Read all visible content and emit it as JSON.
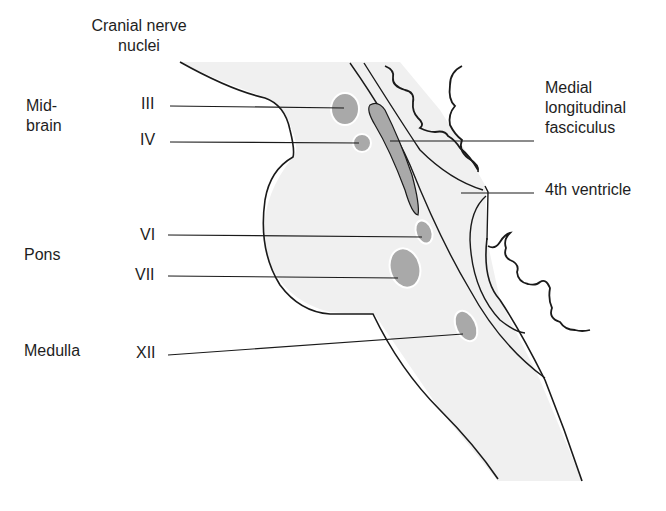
{
  "title": {
    "line1": "Cranial nerve",
    "line2": "nuclei"
  },
  "regions": [
    {
      "id": "midbrain",
      "line1": "Mid-",
      "line2": "brain"
    },
    {
      "id": "pons",
      "line1": "Pons"
    },
    {
      "id": "medulla",
      "line1": "Medulla"
    }
  ],
  "nuclei": [
    {
      "label": "III",
      "fill": "#a9a9a9"
    },
    {
      "label": "IV",
      "fill": "#a9a9a9"
    },
    {
      "label": "VI",
      "fill": "#a9a9a9"
    },
    {
      "label": "VII",
      "fill": "#a9a9a9"
    },
    {
      "label": "XII",
      "fill": "#a9a9a9"
    }
  ],
  "structures": {
    "mlf": {
      "line1": "Medial",
      "line2": "longitudinal",
      "line3": "fasciculus"
    },
    "ventricle": {
      "line1": "4th ventricle"
    }
  },
  "colors": {
    "brainstem_fill": "#f0f0f0",
    "nucleus_fill": "#a9a9a9",
    "outline": "#1a1a1a",
    "background": "#ffffff"
  }
}
